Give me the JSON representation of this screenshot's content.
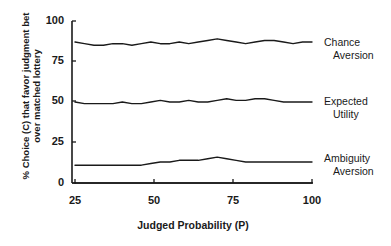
{
  "chart_data": {
    "type": "line",
    "title": "",
    "xlabel": "Judged Probability (P)",
    "ylabel": "% Choice (C) that favor judgment bet over matched lottery",
    "xlim": [
      25,
      100
    ],
    "ylim": [
      0,
      100
    ],
    "xticks": [
      25,
      50,
      75,
      100
    ],
    "yticks": [
      0,
      25,
      50,
      75,
      100
    ],
    "grid": false,
    "legend_position": "right-inline",
    "x": [
      25,
      28,
      31,
      34,
      37,
      40,
      43,
      46,
      49,
      52,
      55,
      58,
      61,
      64,
      67,
      70,
      73,
      76,
      79,
      82,
      85,
      88,
      91,
      94,
      97,
      100
    ],
    "series": [
      {
        "name": "Chance Aversion",
        "label_line1": "Chance",
        "label_line2": "Aversion",
        "values": [
          87,
          86,
          85,
          85,
          86,
          86,
          85,
          86,
          87,
          86,
          86,
          87,
          86,
          87,
          88,
          89,
          88,
          87,
          86,
          87,
          88,
          88,
          87,
          86,
          87,
          87
        ]
      },
      {
        "name": "Expected Utility",
        "label_line1": "Expected",
        "label_line2": "Utility",
        "values": [
          50,
          49,
          49,
          49,
          49,
          50,
          49,
          49,
          50,
          51,
          50,
          50,
          51,
          50,
          50,
          51,
          52,
          51,
          51,
          52,
          52,
          51,
          50,
          50,
          50,
          50
        ]
      },
      {
        "name": "Ambiguity Aversion",
        "label_line1": "Ambiguity",
        "label_line2": "Aversion",
        "values": [
          11,
          11,
          11,
          11,
          11,
          11,
          11,
          11,
          12,
          13,
          13,
          14,
          14,
          14,
          15,
          16,
          15,
          14,
          13,
          13,
          13,
          13,
          13,
          13,
          13,
          13
        ]
      },
      {
        "name": "Baseline",
        "label_line1": "",
        "label_line2": "",
        "values": [
          0,
          0,
          0,
          0,
          0,
          0,
          0,
          0,
          0,
          0,
          0,
          0,
          0,
          0,
          0,
          0,
          0,
          0,
          0,
          0,
          0,
          0,
          0,
          0,
          0,
          0
        ]
      }
    ],
    "colors": {
      "line": "#1a1a1a",
      "axis": "#1a1a1a",
      "background": "#ffffff"
    }
  },
  "axis": {
    "yticklabels": [
      "100",
      "75",
      "50",
      "25",
      "0"
    ],
    "xticklabels": [
      "25",
      "50",
      "75",
      "100"
    ],
    "xlabel": "Judged Probability (P)",
    "ylabel": "% Choice (C) that favor judgment bet over matched lottery"
  },
  "legend": {
    "chance": {
      "line1": "Chance",
      "line2": "Aversion"
    },
    "expected": {
      "line1": "Expected",
      "line2": "Utility"
    },
    "ambiguity": {
      "line1": "Ambiguity",
      "line2": "Aversion"
    }
  }
}
